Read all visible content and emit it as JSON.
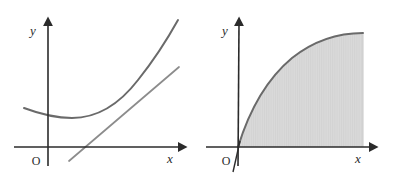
{
  "figure": {
    "background_color": "#ffffff",
    "width": 393,
    "height": 183
  },
  "style": {
    "axis_color": "#2b2b2b",
    "curve_color": "#6a6a6a",
    "tangent_color": "#8c8c8c",
    "fill_color": "#d9d9d9",
    "fill_stripe_color": "#cfcfcf",
    "axis_stroke_width": 1.6,
    "curve_stroke_width": 2.0,
    "tangent_stroke_width": 1.6
  },
  "panels": [
    {
      "id": "left-panel",
      "name": "tangent-line-diagram",
      "caption": "Convex curve with a tangent line",
      "axes": {
        "x_label": "x",
        "y_label": "y",
        "origin_label": "O",
        "x_axis": {
          "x1": 14,
          "y1": 147,
          "x2": 184,
          "y2": 147
        },
        "y_axis": {
          "x1": 48,
          "y1": 166,
          "x2": 48,
          "y2": 20
        },
        "x_label_pos": {
          "x": 170,
          "y": 161
        },
        "y_label_pos": {
          "x": 33,
          "y": 33
        },
        "origin_label_pos": {
          "x": 31,
          "y": 164
        }
      },
      "curves": [
        {
          "name": "convex-curve",
          "kind": "curve",
          "color": "#6a6a6a",
          "path": "M 24 108 C 40 114, 56 118, 72 118 C 96 118, 118 106, 138 80 C 154 60, 168 38, 178 20"
        },
        {
          "name": "tangent-line",
          "kind": "line",
          "color": "#8c8c8c",
          "path": "M 69 161 L 179 67"
        }
      ],
      "tangent_point": {
        "x": 128,
        "y": 94
      }
    },
    {
      "id": "right-panel",
      "name": "area-under-curve-diagram",
      "caption": "Shaded area under a concave increasing curve",
      "axes": {
        "x_label": "x",
        "y_label": "y",
        "origin_label": "O",
        "x_axis": {
          "x1": 206,
          "y1": 147,
          "x2": 375,
          "y2": 147
        },
        "y_axis": {
          "x1": 238,
          "y1": 166,
          "x2": 238,
          "y2": 20
        },
        "x_label_pos": {
          "x": 360,
          "y": 161
        },
        "y_label_pos": {
          "x": 224,
          "y": 33
        },
        "origin_label_pos": {
          "x": 222,
          "y": 164
        }
      },
      "curves": [
        {
          "name": "concave-increasing-curve",
          "kind": "curve",
          "color": "#6a6a6a",
          "path": "M 238 147 C 250 108, 268 78, 292 58 C 316 39, 342 33, 363 33"
        }
      ],
      "shaded_region": {
        "name": "area-fill",
        "fill": "#d9d9d9",
        "right_boundary_x": 363,
        "baseline_y": 147,
        "path": "M 238 147 C 250 108, 268 78, 292 58 C 316 39, 342 33, 363 33 L 363 147 Z"
      }
    }
  ]
}
